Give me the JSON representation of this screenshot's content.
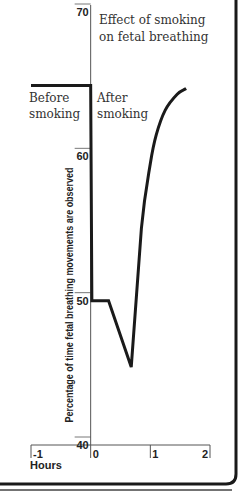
{
  "chart_data": {
    "type": "line",
    "title": "Effect of smoking on fetal breathing",
    "title_lines": [
      "Effect of smoking",
      "on fetal breathing"
    ],
    "xlabel": "Hours",
    "ylabel": "Percentage of time fetal breathing movements are observed",
    "xlim": [
      -1,
      2
    ],
    "ylim": [
      40,
      70
    ],
    "x_ticks": [
      -1,
      0,
      1,
      2
    ],
    "x_tick_labels": [
      "-1",
      "0",
      "1",
      "2"
    ],
    "y_ticks": [
      40,
      50,
      60,
      70
    ],
    "y_tick_labels": [
      "40",
      "50",
      "60",
      "70"
    ],
    "grid": false,
    "annotations": [
      {
        "text_lines": [
          "Before",
          "smoking"
        ],
        "x": -1,
        "y": 64
      },
      {
        "text_lines": [
          "After",
          "smoking"
        ],
        "x": 0.03,
        "y": 64
      }
    ],
    "series": [
      {
        "name": "Fetal breathing",
        "color": "#1a1a1a",
        "points": [
          {
            "x": -1.0,
            "y": 64.9
          },
          {
            "x": 0.0,
            "y": 64.9
          },
          {
            "x": 0.02,
            "y": 50.0
          },
          {
            "x": 0.3,
            "y": 50.0
          },
          {
            "x": 0.68,
            "y": 45.4
          },
          {
            "x": 0.85,
            "y": 55.0
          },
          {
            "x": 1.0,
            "y": 59.5
          },
          {
            "x": 1.1,
            "y": 61.5
          },
          {
            "x": 1.25,
            "y": 63.2
          },
          {
            "x": 1.45,
            "y": 64.3
          },
          {
            "x": 1.6,
            "y": 64.7
          }
        ]
      }
    ]
  }
}
